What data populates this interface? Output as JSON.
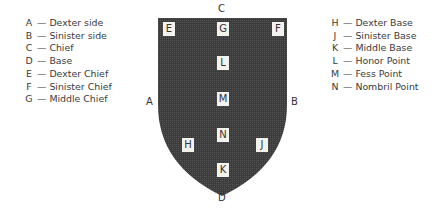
{
  "legend_left": [
    {
      "key": "A",
      "label": "Dexter side"
    },
    {
      "key": "B",
      "label": "Sinister side"
    },
    {
      "key": "C",
      "label": "Chief"
    },
    {
      "key": "D",
      "label": "Base"
    },
    {
      "key": "E",
      "label": "Dexter Chief"
    },
    {
      "key": "F",
      "label": "Sinister Chief"
    },
    {
      "key": "G",
      "label": "Middle Chief"
    }
  ],
  "legend_right": [
    {
      "key": "H",
      "label": "Dexter Base"
    },
    {
      "key": "J",
      "label": "Sinister Base"
    },
    {
      "key": "K",
      "label": "Middle Base"
    },
    {
      "key": "L",
      "label": "Honor Point"
    },
    {
      "key": "M",
      "label": "Fess Point"
    },
    {
      "key": "N",
      "label": "Nombril Point"
    }
  ],
  "dash": "—",
  "outer_points": {
    "A": "A",
    "B": "B",
    "C": "C",
    "D": "D"
  },
  "shield_points": {
    "E": "E",
    "F": "F",
    "G": "G",
    "L": "L",
    "M": "M",
    "N": "N",
    "H": "H",
    "J": "J",
    "K": "K"
  },
  "colors": {
    "shield": "#3c3c3c",
    "box": "#f4f2ec"
  }
}
